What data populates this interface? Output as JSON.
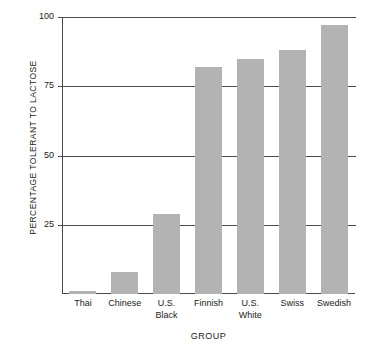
{
  "chart_data": {
    "type": "bar",
    "title": "",
    "subtitle": "",
    "xlabel": "GROUP",
    "ylabel": "PERCENTAGE TOLERANT TO LACTOSE",
    "categories": [
      "Thai",
      "Chinese",
      "U.S.\nBlack",
      "Finnish",
      "U.S.\nWhite",
      "Swiss",
      "Swedish"
    ],
    "values": [
      1,
      8,
      29,
      82,
      85,
      88,
      97
    ],
    "ylim": [
      0,
      100
    ],
    "yticks": [
      25,
      50,
      75,
      100
    ],
    "ytick_labels": [
      "25",
      "50",
      "75",
      "100"
    ],
    "grid": "horizontal",
    "legend": "none",
    "bar_color": "#b3b3b3",
    "axis_color": "#4a4a4a",
    "background": "#ffffff"
  }
}
